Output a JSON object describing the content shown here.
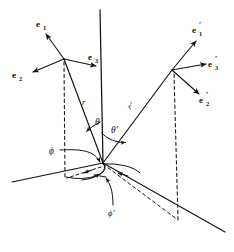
{
  "figure": {
    "background_color": "#ffffff",
    "stroke_color": "#121212",
    "labels": {
      "e1": "e",
      "e1_sub": "1",
      "e2": "e",
      "e2_sub": "2",
      "e3": "e",
      "e3_sub": "3",
      "e1p": "e",
      "e1p_sub": "1",
      "e1p_prime": "′",
      "e2p": "e",
      "e2p_sub": "2",
      "e2p_prime": "′",
      "e3p": "e",
      "e3p_sub": "3",
      "e3p_prime": "′",
      "r": "r",
      "r_prime": "r′",
      "theta": "θ",
      "theta_prime": "θ′",
      "phi": "ϕ",
      "phi_prime": "ϕ′"
    },
    "geometry": {
      "origin": [
        103,
        163
      ],
      "axis_top": [
        100,
        10
      ],
      "left_vertex": [
        64,
        59
      ],
      "right_vertex": [
        172,
        70
      ],
      "left_foot": [
        64,
        176
      ],
      "right_foot": [
        178,
        219
      ],
      "horizontal_axis_left_end": [
        12,
        182
      ],
      "lower_right_axis_end": [
        225,
        232
      ]
    },
    "elements": [
      "vertical-polar-axis",
      "radius-vector-r",
      "radius-vector-r-prime",
      "left-triad-e1",
      "left-triad-e2",
      "left-triad-e3",
      "right-triad-e1-prime",
      "right-triad-e2-prime",
      "right-triad-e3-prime",
      "theta-arc",
      "theta-prime-arc",
      "phi-arc",
      "phi-prime-arc",
      "left-dashed-projection",
      "right-dashed-projection",
      "ground-plane-axes"
    ]
  }
}
